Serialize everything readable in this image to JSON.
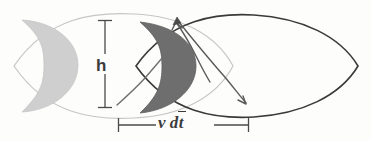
{
  "figure": {
    "background_color": "#fdfdfc",
    "width": 371,
    "height": 141,
    "labels": {
      "height_label": "h",
      "distance_label_v": "v",
      "distance_label_d": "d",
      "distance_label_t": "t",
      "distance_label_full": "v dt"
    },
    "colors": {
      "light_crescent_fill": "#cfcfcf",
      "dark_crescent_fill": "#6e6e6e",
      "light_outline": "#c3c3c3",
      "dark_outline": "#3a3a3a",
      "annotation": "#6f6f6f",
      "text": "#3b3b3b"
    },
    "elements": [
      {
        "name": "light-lens-outline",
        "kind": "lens-outline",
        "shade": "light"
      },
      {
        "name": "dark-lens-outline",
        "kind": "lens-outline",
        "shade": "dark"
      },
      {
        "name": "light-crescent",
        "kind": "crescent",
        "shade": "light"
      },
      {
        "name": "dark-crescent",
        "kind": "crescent",
        "shade": "dark"
      },
      {
        "name": "height-dimension-bar",
        "kind": "dimension",
        "measures": "h"
      },
      {
        "name": "distance-dimension-bar",
        "kind": "dimension",
        "measures": "v dt"
      },
      {
        "name": "flow-arrow-upper",
        "kind": "arrow"
      },
      {
        "name": "flow-arrow-lower",
        "kind": "arrow"
      },
      {
        "name": "flow-arrow-left",
        "kind": "arrow"
      }
    ]
  }
}
